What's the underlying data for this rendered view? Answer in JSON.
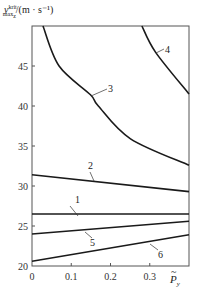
{
  "chart_data": {
    "type": "line",
    "title": "",
    "xlabel": "P̃_y",
    "ylabel": "v_max_z^krit /(m · s⁻¹)",
    "xlim": [
      0,
      0.4
    ],
    "ylim": [
      20,
      50
    ],
    "xticks": [
      0,
      0.1,
      0.2,
      0.3
    ],
    "yticks": [
      20,
      25,
      30,
      35,
      40,
      45
    ],
    "grid": false,
    "legend": "inline numbered labels",
    "series": [
      {
        "name": "1",
        "x": [
          0,
          0.4
        ],
        "y": [
          26.5,
          26.5
        ]
      },
      {
        "name": "2",
        "x": [
          0,
          0.4
        ],
        "y": [
          31.4,
          29.3
        ]
      },
      {
        "name": "3",
        "x": [
          0.028,
          0.069,
          0.149,
          0.169,
          0.251,
          0.4
        ],
        "y": [
          50,
          45,
          41.4,
          40,
          35.9,
          32.6
        ]
      },
      {
        "name": "4",
        "x": [
          0.28,
          0.315,
          0.4
        ],
        "y": [
          50,
          46.7,
          41.5
        ]
      },
      {
        "name": "5",
        "x": [
          0,
          0.4
        ],
        "y": [
          24.0,
          25.6
        ]
      },
      {
        "name": "6",
        "x": [
          0,
          0.4
        ],
        "y": [
          20.6,
          23.9
        ]
      }
    ]
  },
  "labels": {
    "y_main": "v",
    "y_sup": "krit",
    "y_sub": "max",
    "y_subsub": "z",
    "y_unit": "/(m · s⁻¹)",
    "x_main": "P",
    "x_tilde": "~",
    "x_sub": "y"
  },
  "ticks": {
    "x": [
      "0",
      "0.1",
      "0.2",
      "0.3"
    ],
    "y": [
      "20",
      "25",
      "30",
      "35",
      "40",
      "45"
    ]
  },
  "curve_labels": [
    "1",
    "2",
    "3",
    "4",
    "5",
    "6"
  ]
}
